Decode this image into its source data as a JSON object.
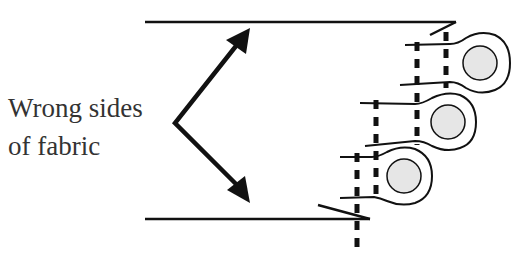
{
  "diagram": {
    "type": "sewing-seam-illustration",
    "label": {
      "line1": "Wrong sides",
      "line2": "of fabric"
    },
    "colors": {
      "stroke": "#111111",
      "text": "#333333",
      "cord_fill": "#e6e6e6",
      "background": "#ffffff"
    },
    "elements": {
      "fabric_layers": 2,
      "piping_loops": 3,
      "stitch_lines": 3,
      "arrows": 2
    }
  }
}
